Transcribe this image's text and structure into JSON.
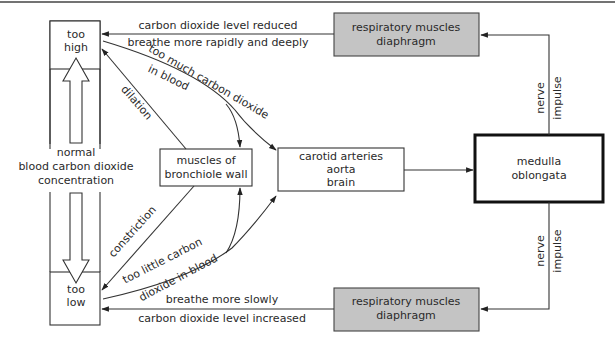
{
  "colors": {
    "grey_box": "#c4c4c4",
    "line": "#333333",
    "background": "#ffffff"
  },
  "left_column": {
    "too_high": [
      "too",
      "high"
    ],
    "too_low": [
      "too",
      "low"
    ],
    "normal": [
      "normal",
      "blood carbon dioxide",
      "concentration"
    ]
  },
  "boxes": {
    "resp_top": [
      "respiratory muscles",
      "diaphragm"
    ],
    "resp_bottom": [
      "respiratory muscles",
      "diaphragm"
    ],
    "bronchiole": [
      "muscles of",
      "bronchiole wall"
    ],
    "carotid": [
      "carotid arteries",
      "aorta",
      "brain"
    ],
    "medulla": [
      "medulla",
      "oblongata"
    ]
  },
  "labels": {
    "top_above": "carbon dioxide level reduced",
    "top_below": "breathe more rapidly and deeply",
    "bottom_above": "breathe more slowly",
    "bottom_below": "carbon dioxide level increased",
    "too_much_1": "too much carbon dioxide",
    "too_much_2": "in blood",
    "too_little_1": "too little carbon",
    "too_little_2": "dioxide in blood",
    "dilation": "dilation",
    "constriction": "constriction",
    "nerve_top": [
      "nerve",
      "impulse"
    ],
    "nerve_bottom": [
      "nerve",
      "impulse"
    ]
  }
}
